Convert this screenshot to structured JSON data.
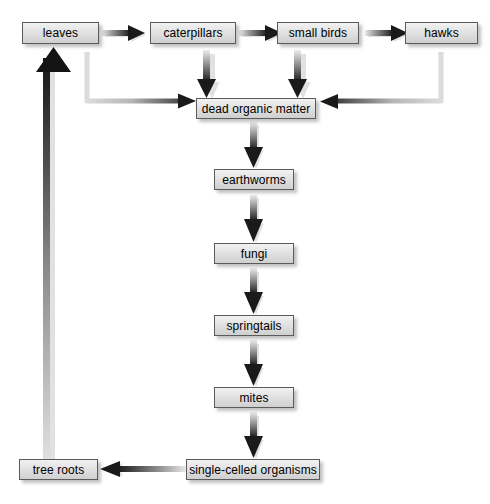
{
  "diagram": {
    "type": "flow-diagram",
    "background_color": "#ffffff",
    "node_fill_color": "#e4e4e4",
    "node_border_color": "#5b5b5b",
    "arrow_color": "#1a1a1a",
    "nodes": [
      {
        "id": "leaves",
        "label": "leaves",
        "x": 22,
        "y": 22,
        "w": 77,
        "h": 22
      },
      {
        "id": "caterpillars",
        "label": "caterpillars",
        "x": 150,
        "y": 22,
        "w": 86,
        "h": 22
      },
      {
        "id": "small-birds",
        "label": "small birds",
        "x": 277,
        "y": 22,
        "w": 82,
        "h": 22
      },
      {
        "id": "hawks",
        "label": "hawks",
        "x": 405,
        "y": 22,
        "w": 73,
        "h": 22
      },
      {
        "id": "dead-organic-matter",
        "label": "dead organic matter",
        "x": 196,
        "y": 98,
        "w": 120,
        "h": 21
      },
      {
        "id": "earthworms",
        "label": "earthworms",
        "x": 214,
        "y": 169,
        "w": 80,
        "h": 21
      },
      {
        "id": "fungi",
        "label": "fungi",
        "x": 214,
        "y": 243,
        "w": 80,
        "h": 21
      },
      {
        "id": "springtails",
        "label": "springtails",
        "x": 214,
        "y": 315,
        "w": 80,
        "h": 21
      },
      {
        "id": "mites",
        "label": "mites",
        "x": 214,
        "y": 387,
        "w": 80,
        "h": 21
      },
      {
        "id": "single-celled-organisms",
        "label": "single-celled organisms",
        "x": 186,
        "y": 459,
        "w": 134,
        "h": 21
      },
      {
        "id": "tree-roots",
        "label": "tree roots",
        "x": 19,
        "y": 459,
        "w": 79,
        "h": 21
      }
    ],
    "edges": [
      {
        "from": "leaves",
        "to": "caterpillars",
        "kind": "straight-right"
      },
      {
        "from": "caterpillars",
        "to": "small-birds",
        "kind": "straight-right"
      },
      {
        "from": "small-birds",
        "to": "hawks",
        "kind": "straight-right"
      },
      {
        "from": "caterpillars",
        "to": "dead-organic-matter",
        "kind": "straight-down"
      },
      {
        "from": "small-birds",
        "to": "dead-organic-matter",
        "kind": "straight-down"
      },
      {
        "from": "leaves",
        "to": "dead-organic-matter",
        "kind": "elbow-left"
      },
      {
        "from": "hawks",
        "to": "dead-organic-matter",
        "kind": "elbow-right"
      },
      {
        "from": "dead-organic-matter",
        "to": "earthworms",
        "kind": "straight-down"
      },
      {
        "from": "earthworms",
        "to": "fungi",
        "kind": "straight-down"
      },
      {
        "from": "fungi",
        "to": "springtails",
        "kind": "straight-down"
      },
      {
        "from": "springtails",
        "to": "mites",
        "kind": "straight-down"
      },
      {
        "from": "mites",
        "to": "single-celled-organisms",
        "kind": "straight-down"
      },
      {
        "from": "single-celled-organisms",
        "to": "tree-roots",
        "kind": "straight-left"
      },
      {
        "from": "tree-roots",
        "to": "leaves",
        "kind": "straight-up"
      }
    ]
  }
}
